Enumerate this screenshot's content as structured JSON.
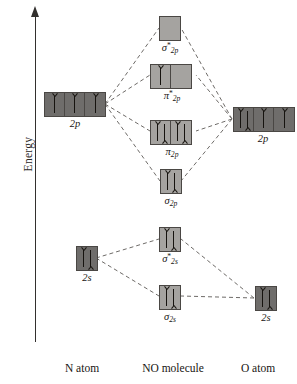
{
  "figure": {
    "type": "molecular-orbital-diagram",
    "molecule": "NO",
    "axis": {
      "label": "Energy",
      "direction": "up",
      "ticks": []
    },
    "columns": [
      {
        "id": "left-atom",
        "caption": "N atom"
      },
      {
        "id": "molecule",
        "caption": "NO molecule"
      },
      {
        "id": "right-atom",
        "caption": "O atom"
      }
    ],
    "colors": {
      "atomic_box_fill": "#6f6d6b",
      "molecular_box_fill": "#a5a3a0",
      "box_border": "#4a4744",
      "arrow": "#16130f",
      "line": "#6e6b68",
      "text": "#181512",
      "background": "#ffffff"
    }
  },
  "levels": {
    "n_2p": {
      "label": "2p",
      "column": "left-atom",
      "boxes": 3,
      "occupancy": [
        "up",
        "up",
        "up"
      ],
      "electrons": 3
    },
    "n_2s": {
      "label": "2s",
      "column": "left-atom",
      "boxes": 1,
      "occupancy": [
        "updown"
      ],
      "electrons": 2
    },
    "o_2p": {
      "label": "2p",
      "column": "right-atom",
      "boxes": 3,
      "occupancy": [
        "updown",
        "up",
        "up"
      ],
      "electrons": 4
    },
    "o_2s": {
      "label": "2s",
      "column": "right-atom",
      "boxes": 1,
      "occupancy": [
        "updown"
      ],
      "electrons": 2
    },
    "sigma_star_2p": {
      "symbol": "σ",
      "star": "*",
      "sub": "2p",
      "column": "molecule",
      "boxes": 1,
      "occupancy": [
        "empty"
      ],
      "electrons": 0
    },
    "pi_star_2p": {
      "symbol": "π",
      "star": "*",
      "sub": "2p",
      "column": "molecule",
      "boxes": 2,
      "occupancy": [
        "up",
        "empty"
      ],
      "electrons": 1
    },
    "pi_2p": {
      "symbol": "π",
      "star": "",
      "sub": "2p",
      "column": "molecule",
      "boxes": 2,
      "occupancy": [
        "updown",
        "updown"
      ],
      "electrons": 4
    },
    "sigma_2p": {
      "symbol": "σ",
      "star": "",
      "sub": "2p",
      "column": "molecule",
      "boxes": 1,
      "occupancy": [
        "updown"
      ],
      "electrons": 2
    },
    "sigma_star_2s": {
      "symbol": "σ",
      "star": "*",
      "sub": "2s",
      "column": "molecule",
      "boxes": 1,
      "occupancy": [
        "updown"
      ],
      "electrons": 2
    },
    "sigma_2s": {
      "symbol": "σ",
      "star": "",
      "sub": "2s",
      "column": "molecule",
      "boxes": 1,
      "occupancy": [
        "updown"
      ],
      "electrons": 2
    }
  }
}
